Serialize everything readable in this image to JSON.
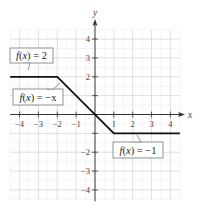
{
  "chart_data": {
    "type": "line",
    "title": "",
    "xlabel": "x",
    "ylabel": "y",
    "xlim": [
      -4.5,
      4.5
    ],
    "ylim": [
      -4.5,
      4.5
    ],
    "grid": true,
    "x_ticks": [
      -4,
      -3,
      -2,
      -1,
      1,
      2,
      3,
      4
    ],
    "y_ticks": [
      -4,
      -3,
      -2,
      -1,
      1,
      2,
      3,
      4
    ],
    "x_tick_labels": [
      "−4",
      "−3",
      "−2",
      "−1",
      "1",
      "2",
      "3",
      "4"
    ],
    "y_tick_labels": [
      "−4",
      "−3",
      "−2",
      "",
      "",
      "2",
      "3",
      "4"
    ],
    "series": [
      {
        "name": "piecewise f(x)",
        "x": [
          -4.5,
          -2,
          1,
          4.5
        ],
        "y": [
          2,
          2,
          -1,
          -1
        ],
        "color": "#111111"
      }
    ],
    "annotations": [
      {
        "text_prefix": "f",
        "text_var": "(x)",
        "text_rhs": " = 2",
        "anchor": [
          -3.5,
          2
        ],
        "placement": "above-left"
      },
      {
        "text_prefix": "f",
        "text_var": "(x)",
        "text_rhs": " = −x",
        "anchor": [
          -1.8,
          1.7
        ],
        "placement": "left"
      },
      {
        "text_prefix": "f",
        "text_var": "(x)",
        "text_rhs": " = −1",
        "anchor": [
          2.4,
          -1
        ],
        "placement": "below-right"
      }
    ]
  }
}
